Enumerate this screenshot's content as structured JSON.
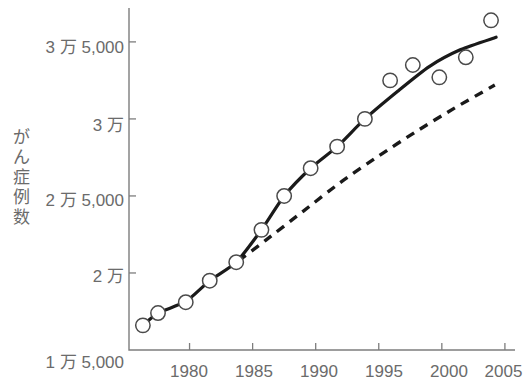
{
  "chart_data": {
    "type": "line",
    "title": "",
    "subtitle": "",
    "xlabel": "",
    "ylabel": "がん症例数",
    "ylabel_chars": [
      "が",
      "ん",
      "症",
      "例",
      "数"
    ],
    "xlim": [
      1975.2,
      2005.8
    ],
    "ylim": [
      15000,
      37200
    ],
    "grid": false,
    "legend_position": "none",
    "x_ticks": [
      1980,
      1985,
      1990,
      1995,
      2000,
      2005
    ],
    "x_tick_labels": [
      "1980",
      "1985",
      "1990",
      "1995",
      "2000",
      "2005"
    ],
    "y_ticks": [
      15000,
      20000,
      25000,
      30000,
      35000
    ],
    "y_tick_labels": [
      "1 万 5,000",
      "2 万",
      "2 万 5,000",
      "3 万",
      "3 万 5,000"
    ],
    "marker_style": "open-circle",
    "scatter": {
      "name": "観測値",
      "x": [
        1976.3,
        1977.5,
        1979.7,
        1981.6,
        1983.7,
        1985.7,
        1987.5,
        1989.6,
        1991.7,
        1993.9,
        1995.9,
        1997.7,
        1999.8,
        2001.9,
        2003.9
      ],
      "y": [
        16600,
        17400,
        18100,
        19500,
        20700,
        22800,
        25000,
        26800,
        28200,
        30000,
        32500,
        33500,
        32700,
        34000,
        36400
      ]
    },
    "series": [
      {
        "name": "実測トレンド",
        "style": "solid",
        "x": [
          1976.3,
          1977.5,
          1979.7,
          1981.6,
          1983.7,
          1985.7,
          1987.5,
          1989.6,
          1991.7,
          1993.9,
          1996.5,
          1999.0,
          2001.5,
          2004.3
        ],
        "y": [
          16600,
          17400,
          18150,
          19500,
          20700,
          22800,
          25000,
          26800,
          28200,
          30000,
          31800,
          33400,
          34500,
          35300
        ]
      },
      {
        "name": "予測トレンド",
        "style": "dashed",
        "x": [
          1983.9,
          1986.0,
          1989.0,
          1992.0,
          1995.0,
          1998.0,
          2001.0,
          2004.2
        ],
        "y": [
          20800,
          22100,
          24000,
          25900,
          27600,
          29200,
          30700,
          32200
        ]
      }
    ]
  },
  "axes": {
    "y_axis_name": "y-axis",
    "x_axis_name": "x-axis"
  }
}
